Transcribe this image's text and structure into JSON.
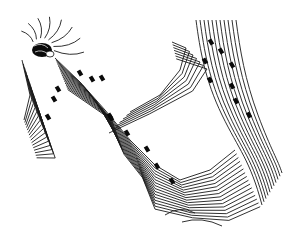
{
  "map": {
    "type": "contour-map",
    "background": "#ffffff",
    "line_color": "#1a1a1a",
    "marker_color": "#0a0a0a",
    "summit": {
      "x": 42,
      "y": 50
    },
    "markers": [
      {
        "x": 80,
        "y": 73
      },
      {
        "x": 92,
        "y": 79
      },
      {
        "x": 102,
        "y": 78
      },
      {
        "x": 58,
        "y": 89
      },
      {
        "x": 54,
        "y": 99
      },
      {
        "x": 48,
        "y": 117
      },
      {
        "x": 110,
        "y": 116
      },
      {
        "x": 111,
        "y": 118
      },
      {
        "x": 127,
        "y": 133
      },
      {
        "x": 147,
        "y": 149
      },
      {
        "x": 157,
        "y": 166
      },
      {
        "x": 172,
        "y": 181
      },
      {
        "x": 211,
        "y": 42
      },
      {
        "x": 221,
        "y": 51
      },
      {
        "x": 205,
        "y": 61
      },
      {
        "x": 232,
        "y": 65
      },
      {
        "x": 210,
        "y": 80
      },
      {
        "x": 232,
        "y": 86
      },
      {
        "x": 236,
        "y": 101
      },
      {
        "x": 249,
        "y": 115
      }
    ]
  }
}
